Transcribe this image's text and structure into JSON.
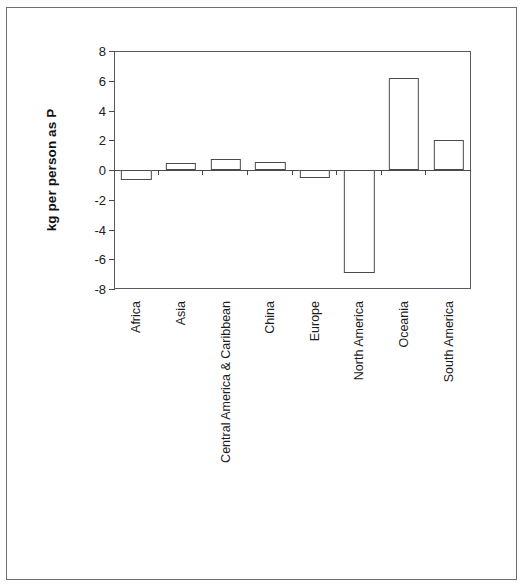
{
  "chart_data": {
    "type": "bar",
    "title": "",
    "subtitle": "",
    "xlabel": "",
    "ylabel": "kg per person as P",
    "ylim": [
      -8,
      8
    ],
    "yticks": [
      8,
      6,
      4,
      2,
      0,
      -2,
      -4,
      -6,
      -8
    ],
    "ytick_labels": [
      "8",
      "6",
      "4",
      "2",
      "0",
      "-2",
      "-4",
      "-6",
      "-8"
    ],
    "grid": false,
    "legend": null,
    "bar_style": {
      "fill": "#ffffff",
      "edge": "#4a4a4a"
    },
    "categories": [
      "Africa",
      "Asia",
      "Central America & Caribbean",
      "China",
      "Europe",
      "North America",
      "Oceania",
      "South America"
    ],
    "values": [
      -0.65,
      0.5,
      0.75,
      0.55,
      -0.55,
      -6.9,
      6.2,
      2.0
    ]
  },
  "axis": {
    "y_title": "kg per person as P"
  },
  "figure": {
    "border_color": "#6e6e6e",
    "background": "#ffffff"
  }
}
